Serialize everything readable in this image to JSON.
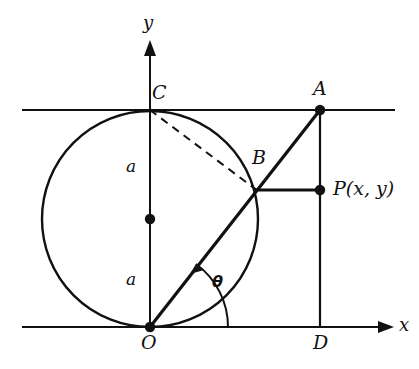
{
  "figure": {
    "type": "geometry-diagram",
    "background_color": "#ffffff",
    "stroke_color": "#111111"
  },
  "axes": {
    "x_label": "x",
    "y_label": "y"
  },
  "points": [
    {
      "name": "O",
      "label": "O",
      "x": 150,
      "y": 327,
      "dot": true
    },
    {
      "name": "C",
      "label": "C",
      "x": 150,
      "y": 110,
      "dot": false
    },
    {
      "name": "center",
      "label": "",
      "x": 150,
      "y": 219,
      "dot": true
    },
    {
      "name": "A",
      "label": "A",
      "x": 320,
      "y": 110,
      "dot": true
    },
    {
      "name": "B",
      "label": "B",
      "x": 257,
      "y": 190,
      "dot": false
    },
    {
      "name": "P",
      "label": "P(x, y)",
      "x": 320,
      "y": 190,
      "dot": true
    },
    {
      "name": "D",
      "label": "D",
      "x": 320,
      "y": 327,
      "dot": false
    }
  ],
  "labels": {
    "point_O": "O",
    "point_C": "C",
    "point_A": "A",
    "point_B": "B",
    "point_D": "D",
    "point_P": "P(x, y)",
    "radius_upper": "a",
    "radius_lower": "a",
    "angle": "θ",
    "axis_x": "x",
    "axis_y": "y"
  },
  "circle": {
    "center_x": 150,
    "center_y": 219,
    "radius": 108,
    "radius_label": "a"
  },
  "segments": [
    {
      "name": "ray-OA",
      "from": "O",
      "to": "A",
      "style": "solid",
      "width": 3
    },
    {
      "name": "chord-CB",
      "from": "C",
      "to": "B",
      "style": "dashed",
      "width": 2
    },
    {
      "name": "segment-BP",
      "from": "B",
      "to": "P",
      "style": "solid",
      "width": 3
    },
    {
      "name": "segment-AD",
      "from": "A",
      "to": "D",
      "style": "solid",
      "width": 2
    },
    {
      "name": "tangent-line-top",
      "from": "x=22,y=110",
      "to": "x=395,y=110",
      "style": "solid",
      "width": 2
    },
    {
      "name": "axis-x",
      "from": "x=22,y=327",
      "to": "x=382,y=327",
      "style": "solid",
      "width": 2
    },
    {
      "name": "axis-y",
      "from": "x=150,y=327",
      "to": "x=150,y=42",
      "style": "solid",
      "width": 2
    }
  ],
  "angle_arc": {
    "vertex": "O",
    "label": "θ",
    "from_ray": "positive x-axis",
    "to_ray": "ray OA",
    "radius": 78,
    "arrow": true
  }
}
